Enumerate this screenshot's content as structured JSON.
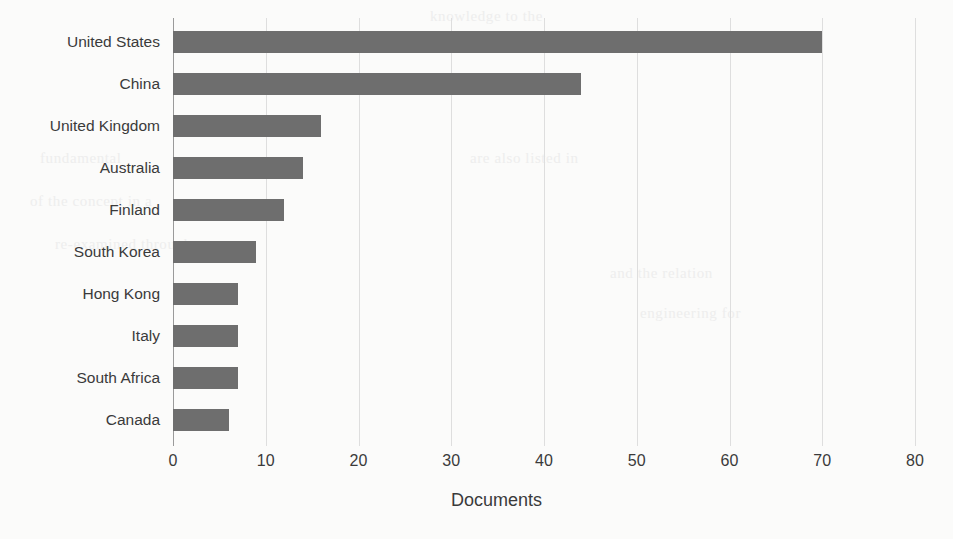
{
  "chart_data": {
    "type": "bar",
    "orientation": "horizontal",
    "title": "",
    "xlabel": "Documents",
    "ylabel": "",
    "categories": [
      "United States",
      "China",
      "United Kingdom",
      "Australia",
      "Finland",
      "South Korea",
      "Hong Kong",
      "Italy",
      "South Africa",
      "Canada"
    ],
    "values": [
      70,
      44,
      16,
      14,
      12,
      9,
      7,
      7,
      7,
      6
    ],
    "xlim": [
      0,
      80
    ],
    "xticks": [
      0,
      10,
      20,
      30,
      40,
      50,
      60,
      70,
      80
    ],
    "xtick_labels": [
      "0",
      "10",
      "20",
      "30",
      "40",
      "50",
      "60",
      "70",
      "80"
    ],
    "grid": true,
    "grid_axis": "x",
    "legend": null,
    "bar_color": "#6e6e6e",
    "grid_color": "#dedede",
    "axis_color": "#9a9a9a",
    "text_color": "#3a3a3a",
    "background_color": "#fbfbfa"
  },
  "scan_artifacts": {
    "ghost_lines": [
      "fundamental",
      "of the concept in a",
      "re-examined through",
      "are also listed in",
      "and the relation",
      "engineering for",
      "knowledge to the"
    ]
  }
}
